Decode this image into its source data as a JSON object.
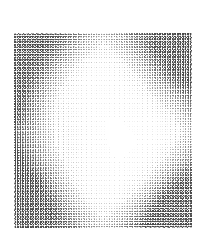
{
  "figure": {
    "background_color": "#ffffff",
    "width": 204,
    "height": 235
  },
  "plot_area": {
    "left": 14,
    "top": 33,
    "width": 178,
    "height": 195,
    "background_color": "#ffffff",
    "border": "none"
  },
  "axes": {
    "title": "",
    "xlabel": "",
    "ylabel": "",
    "xticks": [],
    "yticks": [],
    "xticklabels": [],
    "yticklabels": [],
    "grid": false,
    "frame_visible": false
  },
  "legend": {
    "visible": false,
    "entries": []
  },
  "annotations": [],
  "colors": {
    "arrow_max": "#4a4a4a",
    "arrow_mid": "#9a9a9a",
    "arrow_min": "#ededed",
    "background": "#ffffff"
  },
  "chart_data": {
    "type": "scatter",
    "subtype": "quiver",
    "title": "",
    "xlabel": "",
    "ylabel": "",
    "grid": false,
    "legend_position": "none",
    "xlim": [
      -1,
      1
    ],
    "ylim": [
      -1,
      1
    ],
    "nx": 70,
    "ny": 76,
    "description": "Dense vector field (quiver) plot. Arrow magnitude is near zero inside a bright rhombus/ellipse in the centre of the frame and grows toward the frame corners; the bottom-right corner carries the largest magnitudes, with secondary dark bands at bottom-left, top-right and a concentrated dark patch on the mid-left edge.",
    "field_model": {
      "comment": "Magnitude field m(x,y) on normalized coords x,y in [-1,1]; arrow glyph darkness and length scale with m.",
      "center_null_radius": 0.52,
      "corner_peak": 1.0,
      "hotspots": [
        {
          "name": "bottom-right-corner",
          "x": 0.92,
          "y": -0.92,
          "weight": 1.0
        },
        {
          "name": "bottom-left-region",
          "x": -0.72,
          "y": -0.62,
          "weight": 0.72
        },
        {
          "name": "top-right-region",
          "x": 0.78,
          "y": 0.72,
          "weight": 0.62
        },
        {
          "name": "mid-left-edge-patch",
          "x": -0.95,
          "y": 0.08,
          "weight": 0.85
        },
        {
          "name": "top-left-stripes",
          "x": -0.7,
          "y": 0.8,
          "weight": 0.38
        }
      ]
    },
    "sample_rows": [
      {
        "row_y": 1.0,
        "values": [
          0.34,
          0.33,
          0.33,
          0.32,
          0.32,
          0.31,
          0.31,
          0.3,
          0.3,
          0.29,
          0.29,
          0.29,
          0.28,
          0.28,
          0.28,
          0.28,
          0.28,
          0.28,
          0.29,
          0.29,
          0.3,
          0.31,
          0.32,
          0.33,
          0.34,
          0.35,
          0.36,
          0.37,
          0.38,
          0.39,
          0.4,
          0.41,
          0.42,
          0.43,
          0.44,
          0.45,
          0.46,
          0.47,
          0.47,
          0.48,
          0.49,
          0.5,
          0.51,
          0.52,
          0.53,
          0.54,
          0.55,
          0.56,
          0.57,
          0.58,
          0.58,
          0.59,
          0.6,
          0.61,
          0.62,
          0.62,
          0.63,
          0.63,
          0.64,
          0.64,
          0.65,
          0.65,
          0.65,
          0.66,
          0.66,
          0.66,
          0.66,
          0.66,
          0.66,
          0.66
        ]
      },
      {
        "row_y": 0.6,
        "values": [
          0.4,
          0.39,
          0.37,
          0.36,
          0.34,
          0.33,
          0.31,
          0.3,
          0.28,
          0.27,
          0.25,
          0.24,
          0.22,
          0.21,
          0.19,
          0.18,
          0.16,
          0.15,
          0.13,
          0.12,
          0.1,
          0.09,
          0.07,
          0.06,
          0.05,
          0.04,
          0.03,
          0.02,
          0.02,
          0.01,
          0.01,
          0.01,
          0.01,
          0.01,
          0.01,
          0.01,
          0.01,
          0.02,
          0.02,
          0.03,
          0.04,
          0.06,
          0.08,
          0.1,
          0.13,
          0.16,
          0.19,
          0.23,
          0.26,
          0.3,
          0.33,
          0.37,
          0.4,
          0.43,
          0.46,
          0.49,
          0.52,
          0.54,
          0.56,
          0.58,
          0.6,
          0.61,
          0.62,
          0.63,
          0.64,
          0.64,
          0.65,
          0.65,
          0.65,
          0.65
        ]
      },
      {
        "row_y": 0.08,
        "values": [
          0.85,
          0.82,
          0.78,
          0.73,
          0.68,
          0.63,
          0.58,
          0.53,
          0.48,
          0.43,
          0.38,
          0.34,
          0.3,
          0.26,
          0.22,
          0.19,
          0.16,
          0.13,
          0.1,
          0.08,
          0.06,
          0.04,
          0.03,
          0.02,
          0.01,
          0.01,
          0.0,
          0.0,
          0.0,
          0.0,
          0.0,
          0.0,
          0.0,
          0.0,
          0.0,
          0.0,
          0.0,
          0.0,
          0.0,
          0.0,
          0.0,
          0.0,
          0.01,
          0.01,
          0.02,
          0.03,
          0.05,
          0.07,
          0.09,
          0.12,
          0.15,
          0.18,
          0.21,
          0.25,
          0.28,
          0.32,
          0.35,
          0.38,
          0.41,
          0.44,
          0.46,
          0.48,
          0.5,
          0.51,
          0.52,
          0.53,
          0.53,
          0.54,
          0.54,
          0.54
        ]
      },
      {
        "row_y": -0.45,
        "values": [
          0.7,
          0.7,
          0.7,
          0.7,
          0.7,
          0.69,
          0.69,
          0.68,
          0.67,
          0.66,
          0.65,
          0.63,
          0.61,
          0.59,
          0.56,
          0.53,
          0.5,
          0.46,
          0.42,
          0.38,
          0.34,
          0.3,
          0.26,
          0.22,
          0.18,
          0.15,
          0.12,
          0.09,
          0.07,
          0.05,
          0.03,
          0.02,
          0.01,
          0.01,
          0.0,
          0.0,
          0.0,
          0.01,
          0.01,
          0.02,
          0.03,
          0.05,
          0.07,
          0.09,
          0.12,
          0.15,
          0.18,
          0.22,
          0.26,
          0.3,
          0.34,
          0.38,
          0.43,
          0.47,
          0.51,
          0.55,
          0.59,
          0.63,
          0.66,
          0.7,
          0.73,
          0.76,
          0.78,
          0.8,
          0.82,
          0.84,
          0.85,
          0.86,
          0.87,
          0.88
        ]
      },
      {
        "row_y": -1.0,
        "values": [
          0.7,
          0.7,
          0.7,
          0.7,
          0.7,
          0.7,
          0.7,
          0.7,
          0.7,
          0.7,
          0.7,
          0.7,
          0.7,
          0.7,
          0.7,
          0.7,
          0.69,
          0.69,
          0.68,
          0.67,
          0.66,
          0.65,
          0.64,
          0.62,
          0.6,
          0.58,
          0.56,
          0.53,
          0.5,
          0.47,
          0.44,
          0.41,
          0.38,
          0.36,
          0.34,
          0.33,
          0.33,
          0.34,
          0.36,
          0.39,
          0.43,
          0.47,
          0.52,
          0.57,
          0.62,
          0.67,
          0.72,
          0.77,
          0.81,
          0.85,
          0.88,
          0.91,
          0.93,
          0.95,
          0.96,
          0.97,
          0.98,
          0.99,
          0.99,
          1.0,
          1.0,
          1.0,
          1.0,
          1.0,
          1.0,
          1.0,
          1.0,
          1.0,
          1.0,
          1.0
        ]
      }
    ]
  }
}
